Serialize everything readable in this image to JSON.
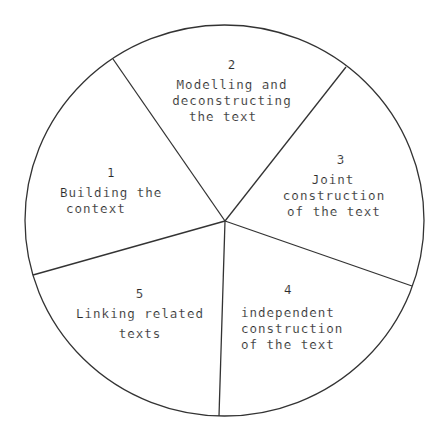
{
  "diagram": {
    "type": "cycle-wheel",
    "segment_count": 5,
    "stroke_color": "#333333",
    "background_color": "#ffffff",
    "text_color": "#2a2a2a",
    "segments": [
      {
        "number": "1",
        "lines": [
          "Building the",
          "context"
        ]
      },
      {
        "number": "2",
        "lines": [
          "Modelling and",
          "deconstructing",
          "the text"
        ]
      },
      {
        "number": "3",
        "lines": [
          "Joint",
          "construction",
          "of the text"
        ]
      },
      {
        "number": "4",
        "lines": [
          "independent",
          "construction",
          "of the text"
        ]
      },
      {
        "number": "5",
        "lines": [
          "Linking related",
          "texts"
        ]
      }
    ]
  }
}
